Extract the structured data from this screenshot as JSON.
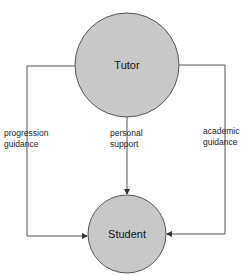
{
  "diagram": {
    "nodes": [
      {
        "id": "tutor",
        "label": "Tutor",
        "cx": 127,
        "cy": 65,
        "r": 52
      },
      {
        "id": "student",
        "label": "Student",
        "cx": 127,
        "cy": 234,
        "r": 39
      }
    ],
    "edges": [
      {
        "from": "tutor",
        "to": "student",
        "route": "left",
        "label_line1": "progression",
        "label_line2": "guidance"
      },
      {
        "from": "tutor",
        "to": "student",
        "route": "center",
        "label_line1": "personal",
        "label_line2": "support"
      },
      {
        "from": "tutor",
        "to": "student",
        "route": "right",
        "label_line1": "academic",
        "label_line2": "guidance"
      }
    ],
    "colors": {
      "node_fill": "#c8c8c8",
      "stroke": "#555555"
    }
  }
}
